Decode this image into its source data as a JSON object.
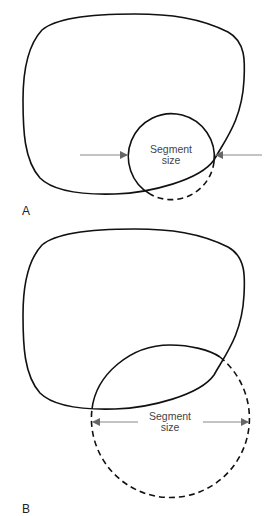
{
  "figure": {
    "panels": [
      {
        "label": "A",
        "segment_label_line1": "Segment",
        "segment_label_line2": "size",
        "description": "Small circle partially overlapping blob boundary; arrows point inward"
      },
      {
        "label": "B",
        "segment_label_line1": "Segment",
        "segment_label_line2": "size",
        "description": "Large circle overlapping blob boundary; double-headed arrow spans diameter"
      }
    ],
    "colors": {
      "stroke": "#111111",
      "arrow": "#888888",
      "text": "#444444"
    }
  }
}
